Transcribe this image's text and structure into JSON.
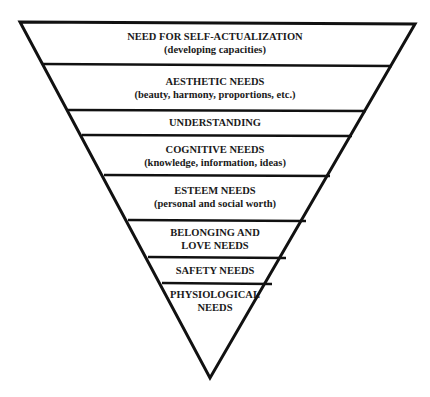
{
  "diagram": {
    "levels": [
      {
        "name": "NEED FOR SELF-ACTUALIZATION",
        "detail": "(developing capacities)"
      },
      {
        "name": "AESTHETIC NEEDS",
        "detail": "(beauty, harmony, proportions, etc.)"
      },
      {
        "name": "UNDERSTANDING",
        "detail": ""
      },
      {
        "name": "COGNITIVE NEEDS",
        "detail": "(knowledge, information, ideas)"
      },
      {
        "name": "ESTEEM NEEDS",
        "detail": "(personal and social worth)"
      },
      {
        "name": "BELONGING AND",
        "detail": "LOVE NEEDS"
      },
      {
        "name": "SAFETY NEEDS",
        "detail": ""
      },
      {
        "name": "PHYSIOLOGICAL",
        "detail": "NEEDS"
      }
    ]
  }
}
